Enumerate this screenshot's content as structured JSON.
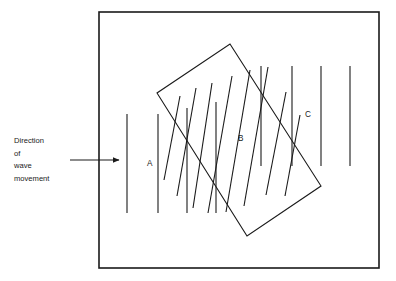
{
  "figure": {
    "type": "physics-wave-refraction-diagram",
    "background_color": "#ffffff",
    "stroke_color": "#1a1a1a",
    "frame": {
      "name": "outer-border-rectangle",
      "x": 99,
      "y": 12,
      "width": 280,
      "height": 256,
      "stroke_width": 1.6
    },
    "annotation": {
      "label_lines": [
        "Direction",
        "of",
        "wave",
        "movement"
      ],
      "line_1": "Direction",
      "line_2": "of",
      "line_3": "wave",
      "line_4": "movement",
      "x": 14,
      "y_start": 140,
      "line_height": 12.5,
      "arrow": {
        "name": "direction-arrow",
        "x1": 70,
        "y1": 160,
        "x2": 120,
        "y2": 160
      }
    },
    "regions": [
      {
        "id": "A",
        "label": "A",
        "label_x": 147,
        "label_y": 166,
        "description": "incident-wavefronts-region"
      },
      {
        "id": "B",
        "label": "B",
        "label_x": 238,
        "label_y": 141,
        "description": "refracting-medium-region"
      },
      {
        "id": "C",
        "label": "C",
        "label_x": 305,
        "label_y": 117,
        "description": "transmitted-wavefronts-region"
      }
    ],
    "medium_block": {
      "name": "tilted-rectangle-medium",
      "corners": [
        {
          "x": 230,
          "y": 44
        },
        {
          "x": 321,
          "y": 186
        },
        {
          "x": 247,
          "y": 236
        },
        {
          "x": 157,
          "y": 93
        }
      ],
      "stroke_width": 1.1
    },
    "wavefronts_incident": {
      "description": "vertical straight wavefront lines left of and entering the block",
      "stroke_width": 1.1,
      "lines": [
        {
          "x1": 127,
          "y1": 114,
          "x2": 127,
          "y2": 213
        },
        {
          "x1": 158,
          "y1": 114,
          "x2": 158,
          "y2": 213
        },
        {
          "x1": 187,
          "y1": 108,
          "x2": 187,
          "y2": 213
        },
        {
          "x1": 216,
          "y1": 102,
          "x2": 216,
          "y2": 213
        }
      ]
    },
    "wavefronts_transmitted": {
      "description": "vertical straight wavefront lines right of the block",
      "stroke_width": 1.1,
      "lines": [
        {
          "x1": 261,
          "y1": 66,
          "x2": 261,
          "y2": 166
        },
        {
          "x1": 292,
          "y1": 66,
          "x2": 292,
          "y2": 166
        },
        {
          "x1": 321,
          "y1": 66,
          "x2": 321,
          "y2": 166
        },
        {
          "x1": 350,
          "y1": 66,
          "x2": 350,
          "y2": 166
        }
      ]
    },
    "wavefronts_refracted": {
      "description": "tilted wavefront lines inside the block (refracted, bent toward the normal)",
      "stroke_width": 1.1,
      "lines": [
        {
          "x1": 180,
          "y1": 96,
          "x2": 164,
          "y2": 180
        },
        {
          "x1": 196,
          "y1": 88,
          "x2": 177,
          "y2": 196
        },
        {
          "x1": 212,
          "y1": 83,
          "x2": 193,
          "y2": 208
        },
        {
          "x1": 232,
          "y1": 76,
          "x2": 208,
          "y2": 213
        },
        {
          "x1": 250,
          "y1": 70,
          "x2": 226,
          "y2": 212
        },
        {
          "x1": 268,
          "y1": 67,
          "x2": 244,
          "y2": 206
        },
        {
          "x1": 286,
          "y1": 92,
          "x2": 266,
          "y2": 195
        },
        {
          "x1": 300,
          "y1": 115,
          "x2": 285,
          "y2": 196
        }
      ]
    }
  }
}
